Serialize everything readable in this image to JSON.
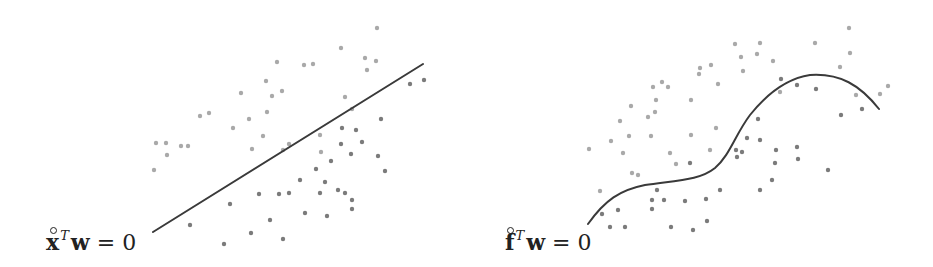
{
  "colors": {
    "line": "#3a3a3a",
    "class_light": "#a9a9a9",
    "class_dark": "#7b7b7b"
  },
  "left_panel": {
    "label": {
      "vector": "x",
      "superscript": "T",
      "weights": "w",
      "equals": "= 0"
    },
    "boundary": {
      "type": "linear",
      "from": [
        153,
        232
      ],
      "to": [
        423,
        64
      ]
    },
    "points_light": [
      [
        154,
        170
      ],
      [
        156,
        143
      ],
      [
        166,
        143
      ],
      [
        167,
        155
      ],
      [
        181,
        146
      ],
      [
        188,
        146
      ],
      [
        200,
        116
      ],
      [
        209,
        113
      ],
      [
        233,
        128
      ],
      [
        241,
        93
      ],
      [
        249,
        119
      ],
      [
        252,
        149
      ],
      [
        263,
        136
      ],
      [
        266,
        81
      ],
      [
        267,
        112
      ],
      [
        272,
        96
      ],
      [
        277,
        62
      ],
      [
        282,
        91
      ],
      [
        283,
        150
      ],
      [
        289,
        144
      ],
      [
        304,
        65
      ],
      [
        313,
        64
      ],
      [
        320,
        135
      ],
      [
        321,
        152
      ],
      [
        341,
        48
      ],
      [
        345,
        97
      ],
      [
        352,
        109
      ],
      [
        365,
        58
      ],
      [
        367,
        70
      ],
      [
        377,
        28
      ],
      [
        376,
        61
      ]
    ],
    "points_dark": [
      [
        190,
        225
      ],
      [
        224,
        244
      ],
      [
        230,
        204
      ],
      [
        251,
        233
      ],
      [
        259,
        194
      ],
      [
        270,
        220
      ],
      [
        279,
        194
      ],
      [
        283,
        239
      ],
      [
        289,
        193
      ],
      [
        300,
        180
      ],
      [
        305,
        213
      ],
      [
        316,
        169
      ],
      [
        320,
        193
      ],
      [
        325,
        182
      ],
      [
        327,
        216
      ],
      [
        331,
        161
      ],
      [
        338,
        190
      ],
      [
        341,
        144
      ],
      [
        342,
        128
      ],
      [
        345,
        193
      ],
      [
        351,
        154
      ],
      [
        352,
        200
      ],
      [
        352,
        209
      ],
      [
        356,
        130
      ],
      [
        362,
        142
      ],
      [
        378,
        156
      ],
      [
        381,
        119
      ],
      [
        385,
        171
      ],
      [
        410,
        84
      ],
      [
        424,
        80
      ]
    ]
  },
  "right_panel": {
    "label": {
      "vector": "f",
      "superscript": "T",
      "weights": "w",
      "equals": "= 0"
    },
    "boundary": {
      "type": "nonlinear",
      "path": "M588,224 C605,200 620,190 645,185 C680,180 700,180 715,168 C730,155 735,135 750,115 C770,90 790,78 810,75 C840,73 860,85 879,109"
    },
    "points_light": [
      [
        589,
        149
      ],
      [
        600,
        191
      ],
      [
        611,
        141
      ],
      [
        620,
        121
      ],
      [
        623,
        153
      ],
      [
        629,
        136
      ],
      [
        631,
        106
      ],
      [
        632,
        173
      ],
      [
        638,
        175
      ],
      [
        648,
        117
      ],
      [
        651,
        136
      ],
      [
        653,
        87
      ],
      [
        655,
        112
      ],
      [
        656,
        100
      ],
      [
        662,
        82
      ],
      [
        668,
        87
      ],
      [
        670,
        153
      ],
      [
        676,
        164
      ],
      [
        691,
        135
      ],
      [
        691,
        100
      ],
      [
        699,
        74
      ],
      [
        700,
        68
      ],
      [
        711,
        65
      ],
      [
        710,
        150
      ],
      [
        716,
        128
      ],
      [
        718,
        84
      ],
      [
        735,
        44
      ],
      [
        741,
        57
      ],
      [
        743,
        71
      ],
      [
        757,
        54
      ],
      [
        760,
        43
      ],
      [
        773,
        61
      ],
      [
        780,
        92
      ],
      [
        815,
        43
      ],
      [
        840,
        67
      ],
      [
        849,
        28
      ],
      [
        850,
        53
      ],
      [
        856,
        95
      ],
      [
        880,
        94
      ],
      [
        888,
        86
      ]
    ],
    "points_dark": [
      [
        602,
        214
      ],
      [
        610,
        227
      ],
      [
        618,
        210
      ],
      [
        625,
        227
      ],
      [
        652,
        200
      ],
      [
        652,
        209
      ],
      [
        657,
        190
      ],
      [
        664,
        200
      ],
      [
        671,
        227
      ],
      [
        685,
        201
      ],
      [
        690,
        163
      ],
      [
        693,
        230
      ],
      [
        706,
        199
      ],
      [
        707,
        221
      ],
      [
        720,
        190
      ],
      [
        736,
        150
      ],
      [
        737,
        157
      ],
      [
        742,
        152
      ],
      [
        747,
        138
      ],
      [
        758,
        119
      ],
      [
        760,
        140
      ],
      [
        760,
        190
      ],
      [
        775,
        163
      ],
      [
        772,
        180
      ],
      [
        776,
        150
      ],
      [
        781,
        79
      ],
      [
        797,
        147
      ],
      [
        797,
        85
      ],
      [
        798,
        159
      ],
      [
        816,
        89
      ],
      [
        828,
        170
      ],
      [
        841,
        115
      ],
      [
        862,
        109
      ]
    ]
  },
  "chart_data": {
    "type": "scatter",
    "title": "",
    "series": [
      {
        "name": "Linear decision boundary",
        "label": "x̊^T w = 0",
        "classes": [
          "light",
          "dark"
        ]
      },
      {
        "name": "Nonlinear decision boundary",
        "label": "f̊^T w = 0",
        "classes": [
          "light",
          "dark"
        ]
      }
    ],
    "xlabel": "",
    "ylabel": "",
    "grid": false,
    "axes": false
  }
}
